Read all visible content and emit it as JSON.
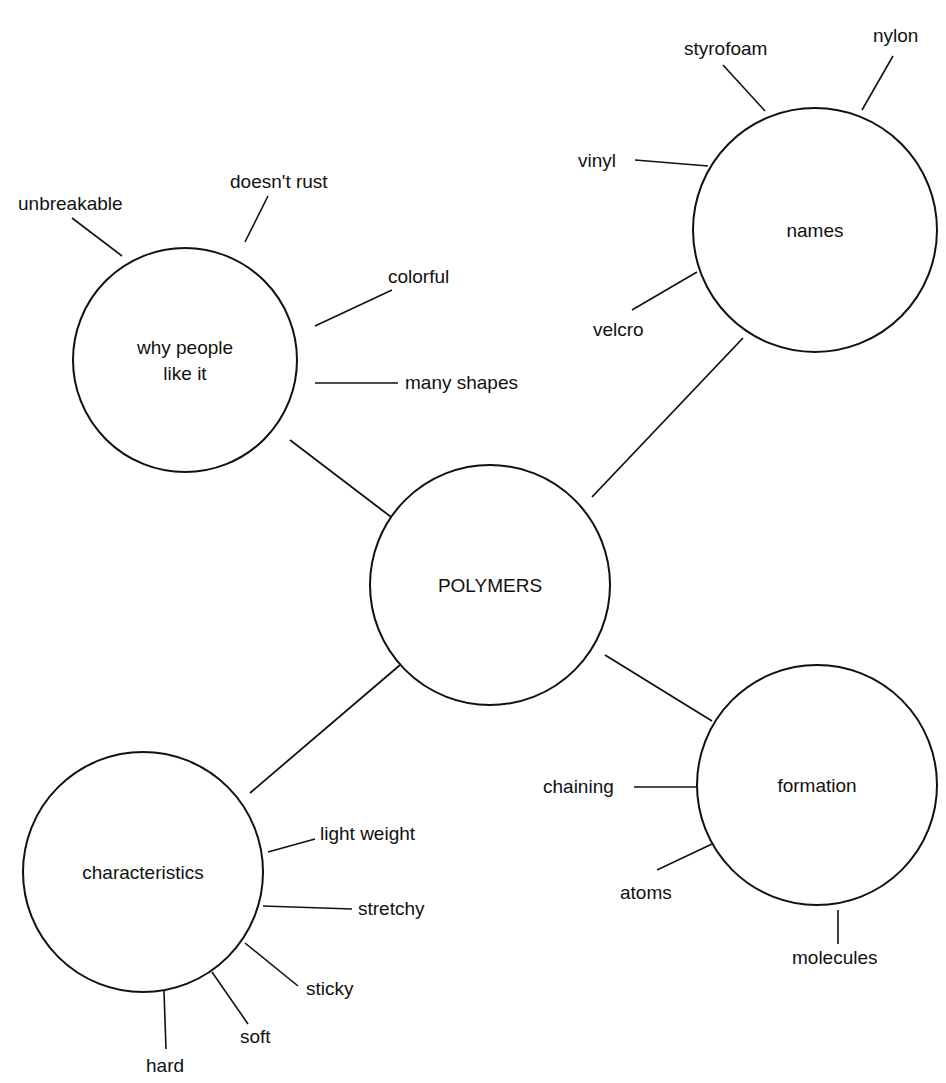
{
  "diagram": {
    "title": "POLYMERS",
    "colors": {
      "stroke": "#111111",
      "background": "#ffffff",
      "text": "#111111"
    },
    "center": {
      "label": "POLYMERS",
      "cx": 490,
      "cy": 585,
      "r": 120
    },
    "branches": [
      {
        "id": "why",
        "label_lines": [
          "why people",
          "like it"
        ],
        "cx": 185,
        "cy": 360,
        "r": 112,
        "edge": [
          290,
          440,
          395,
          520
        ],
        "leaves": [
          {
            "label": "unbreakable",
            "x": 18,
            "y": 210,
            "line": [
              72,
              218,
              122,
              256
            ]
          },
          {
            "label": "doesn't rust",
            "x": 230,
            "y": 188,
            "line": [
              268,
              196,
              245,
              242
            ]
          },
          {
            "label": "colorful",
            "x": 388,
            "y": 283,
            "line": [
              392,
              290,
              315,
              326
            ]
          },
          {
            "label": "many shapes",
            "x": 405,
            "y": 389,
            "line": [
              398,
              383,
              315,
              383
            ]
          }
        ]
      },
      {
        "id": "names",
        "label_lines": [
          "names"
        ],
        "cx": 815,
        "cy": 230,
        "r": 122,
        "edge": [
          743,
          338,
          592,
          497
        ],
        "leaves": [
          {
            "label": "styrofoam",
            "x": 684,
            "y": 55,
            "line": [
              723,
              65,
              765,
              111
            ]
          },
          {
            "label": "nylon",
            "x": 873,
            "y": 42,
            "line": [
              893,
              56,
              862,
              110
            ]
          },
          {
            "label": "vinyl",
            "x": 578,
            "y": 167,
            "line": [
              635,
              160,
              708,
              166
            ]
          },
          {
            "label": "velcro",
            "x": 593,
            "y": 336,
            "line": [
              632,
              310,
              697,
              272
            ]
          }
        ]
      },
      {
        "id": "characteristics",
        "label_lines": [
          "characteristics"
        ],
        "cx": 143,
        "cy": 872,
        "r": 120,
        "edge": [
          400,
          665,
          250,
          793
        ],
        "leaves": [
          {
            "label": "light weight",
            "x": 320,
            "y": 840,
            "line": [
              315,
              839,
              268,
              852
            ]
          },
          {
            "label": "stretchy",
            "x": 358,
            "y": 915,
            "line": [
              352,
              909,
              263,
              906
            ]
          },
          {
            "label": "sticky",
            "x": 306,
            "y": 995,
            "line": [
              298,
              986,
              245,
              943
            ]
          },
          {
            "label": "soft",
            "x": 240,
            "y": 1043,
            "line": [
              248,
              1024,
              212,
              972
            ]
          },
          {
            "label": "hard",
            "x": 146,
            "y": 1072,
            "line": [
              166,
              1049,
              164,
              991
            ]
          }
        ]
      },
      {
        "id": "formation",
        "label_lines": [
          "formation"
        ],
        "cx": 817,
        "cy": 785,
        "r": 120,
        "edge": [
          605,
          655,
          712,
          721
        ],
        "leaves": [
          {
            "label": "chaining",
            "x": 543,
            "y": 793,
            "line": [
              634,
              787,
              699,
              787
            ]
          },
          {
            "label": "atoms",
            "x": 620,
            "y": 899,
            "line": [
              657,
              870,
              712,
              844
            ]
          },
          {
            "label": "molecules",
            "x": 792,
            "y": 964,
            "line": [
              838,
              944,
              838,
              910
            ]
          }
        ]
      }
    ]
  }
}
